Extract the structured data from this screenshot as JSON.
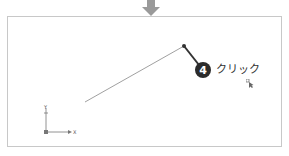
{
  "callout": {
    "step_number": "4",
    "action_label": "クリック"
  },
  "ucs_icon": {
    "x_label": "X",
    "y_label": "Y"
  },
  "colors": {
    "frame_border": "#c8c8c8",
    "arrow": "#9a9a9a",
    "line": "#888888",
    "leader": "#333333",
    "badge": "#2b2b2b"
  }
}
